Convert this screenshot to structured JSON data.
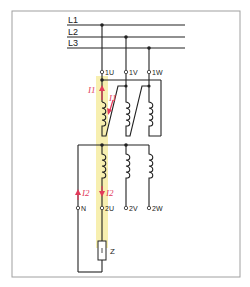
{
  "diagram": {
    "type": "three-phase transformer wiring schematic",
    "bus_lines": [
      {
        "label": "L1"
      },
      {
        "label": "L2"
      },
      {
        "label": "L3"
      }
    ],
    "primary_terminals": [
      "1U",
      "1V",
      "1W"
    ],
    "secondary_terminals": [
      "N",
      "2U",
      "2V",
      "2W"
    ],
    "currents": {
      "primary_1": "I1",
      "primary_1_sub": "1",
      "primary_2": "I1",
      "primary_2_sub": "1",
      "secondary_1": "I2",
      "secondary_1_sub": "2",
      "secondary_2": "I2",
      "secondary_2_sub": "2"
    },
    "load": {
      "label": "Z"
    },
    "colors": {
      "wire": "#222222",
      "highlight": "#f7efb0",
      "current_arrow": "#e23a5a",
      "frame": "#a0a0a0"
    }
  }
}
